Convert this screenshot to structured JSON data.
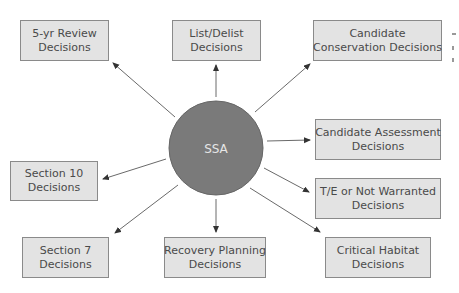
{
  "diagram": {
    "hub": {
      "label": "SSA",
      "fill": "#7a7a7a"
    },
    "nodes": [
      {
        "id": "five-yr-review",
        "line1": "5-yr Review",
        "line2": "Decisions"
      },
      {
        "id": "list-delist",
        "line1": "List/Delist",
        "line2": "Decisions"
      },
      {
        "id": "candidate-conservation",
        "line1": "Candidate",
        "line2": "Conservation Decisions"
      },
      {
        "id": "candidate-assessment",
        "line1": "Candidate Assessment",
        "line2": "Decisions"
      },
      {
        "id": "te-not-warranted",
        "line1": "T/E or Not Warranted",
        "line2": "Decisions"
      },
      {
        "id": "critical-habitat",
        "line1": "Critical Habitat",
        "line2": "Decisions"
      },
      {
        "id": "recovery-planning",
        "line1": "Recovery Planning",
        "line2": "Decisions"
      },
      {
        "id": "section-7",
        "line1": "Section 7",
        "line2": "Decisions"
      },
      {
        "id": "section-10",
        "line1": "Section 10",
        "line2": "Decisions"
      }
    ],
    "edges": [
      {
        "from": "SSA",
        "to": "5-yr Review Decisions"
      },
      {
        "from": "SSA",
        "to": "List/Delist Decisions"
      },
      {
        "from": "SSA",
        "to": "Candidate Conservation Decisions"
      },
      {
        "from": "SSA",
        "to": "Candidate Assessment Decisions"
      },
      {
        "from": "SSA",
        "to": "T/E or Not Warranted Decisions"
      },
      {
        "from": "SSA",
        "to": "Critical Habitat Decisions"
      },
      {
        "from": "SSA",
        "to": "Recovery Planning Decisions"
      },
      {
        "from": "SSA",
        "to": "Section 7 Decisions"
      },
      {
        "from": "SSA",
        "to": "Section 10 Decisions"
      }
    ],
    "colors": {
      "box_fill": "#e3e3e3",
      "box_border": "#8a8a8a",
      "arrow": "#444444",
      "hub_text": "#e6e6e6"
    }
  }
}
